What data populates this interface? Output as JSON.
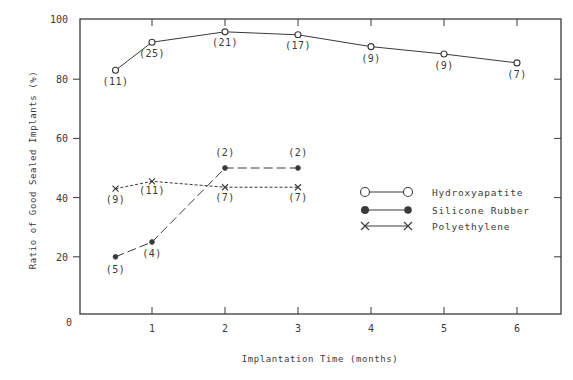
{
  "chart_data": {
    "type": "line",
    "title": "",
    "xlabel": "Implantation Time (months)",
    "ylabel": "Ratio of Good Sealed Implants (%)",
    "xlim": [
      0,
      6.6
    ],
    "ylim": [
      0,
      100
    ],
    "xticks": [
      1,
      2,
      3,
      4,
      5,
      6
    ],
    "yticks": [
      20,
      40,
      60,
      80,
      100
    ],
    "origin_label": "0",
    "grid": false,
    "legend_position": "center-right",
    "series": [
      {
        "name": "Hydroxyapatite",
        "marker": "open-circle",
        "line_style": "solid",
        "x": [
          0.5,
          1,
          2,
          3,
          4,
          5,
          6
        ],
        "values": [
          83,
          92.5,
          96,
          95,
          91,
          88.5,
          85.5
        ],
        "counts": [
          "(11)",
          "(25)",
          "(21)",
          "(17)",
          "(9)",
          "(9)",
          "(7)"
        ]
      },
      {
        "name": "Silicone Rubber",
        "marker": "filled-circle",
        "line_style": "long-dash",
        "x": [
          0.5,
          1,
          2,
          3
        ],
        "values": [
          20,
          25,
          50,
          50
        ],
        "counts": [
          "(5)",
          "(4)",
          "(2)",
          "(2)"
        ]
      },
      {
        "name": "Polyethylene",
        "marker": "x",
        "line_style": "short-dash",
        "x": [
          0.5,
          1,
          2,
          3
        ],
        "values": [
          43,
          45.5,
          43.5,
          43.5
        ],
        "counts": [
          "(9)",
          "(11)",
          "(7)",
          "(7)"
        ]
      }
    ]
  },
  "colors": {
    "ink": "#3a3a3a",
    "background": "#ffffff"
  }
}
